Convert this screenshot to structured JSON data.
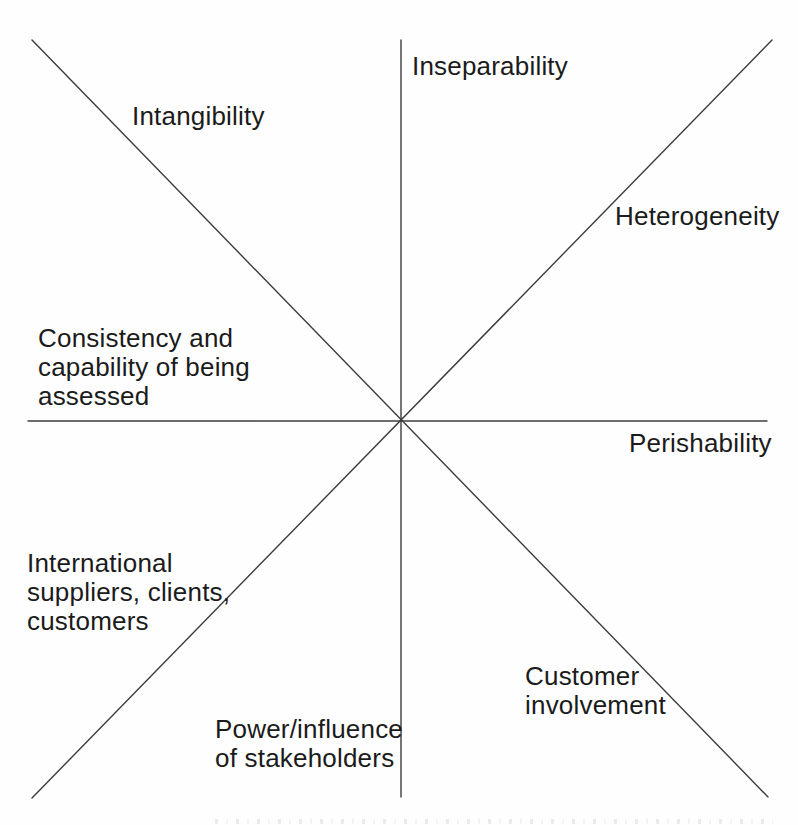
{
  "diagram": {
    "type": "radial-spoke-diagram",
    "background_color": "#fefefe",
    "line_color": "#3c3c3c",
    "text_color": "#1b1b1b",
    "labels": {
      "inseparability": {
        "text": "Inseparability"
      },
      "intangibility": {
        "text": "Intangibility"
      },
      "heterogeneity": {
        "text": "Heterogeneity"
      },
      "consistency": {
        "line1": "Consistency and",
        "line2": "capability of being",
        "line3": "assessed"
      },
      "perishability": {
        "text": "Perishability"
      },
      "international": {
        "line1": "International",
        "line2": "suppliers, clients,",
        "line3": "customers"
      },
      "customer_involvement": {
        "line1": "Customer",
        "line2": "involvement"
      },
      "power_influence": {
        "line1": "Power/influence",
        "line2": "of stakeholders"
      }
    }
  }
}
